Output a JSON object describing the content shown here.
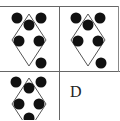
{
  "puzzle": {
    "colors": {
      "line": "#555555",
      "grid_line": "#666666",
      "dot": "#111111",
      "background": "#ffffff"
    },
    "cells": [
      {
        "id": "top-left",
        "diamond": {
          "cx": 29,
          "cy": 40,
          "halfw": 17,
          "halfh": 26
        },
        "dots": [
          [
            17,
            18
          ],
          [
            41,
            18
          ],
          [
            29,
            25
          ],
          [
            19,
            41
          ],
          [
            39,
            41
          ],
          [
            41,
            63
          ]
        ]
      },
      {
        "id": "top-right",
        "diamond": {
          "cx": 88,
          "cy": 40,
          "halfw": 17,
          "halfh": 26
        },
        "dots": [
          [
            76,
            18
          ],
          [
            100,
            18
          ],
          [
            88,
            25
          ],
          [
            78,
            41
          ],
          [
            98,
            41
          ],
          [
            101,
            63
          ]
        ]
      },
      {
        "id": "bottom-left",
        "diamond": {
          "cx": 29,
          "cy": 104,
          "halfw": 17,
          "halfh": 26
        },
        "dots": [
          [
            16,
            82
          ],
          [
            41,
            82
          ],
          [
            29,
            88
          ],
          [
            19,
            104
          ],
          [
            39,
            104
          ],
          [
            29,
            118
          ]
        ]
      }
    ],
    "answer_cell": {
      "id": "bottom-right",
      "label": "D"
    }
  }
}
